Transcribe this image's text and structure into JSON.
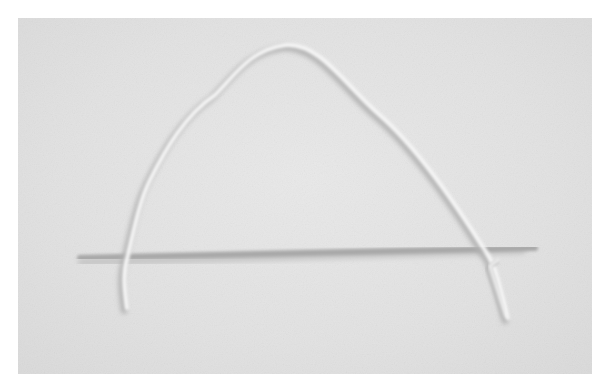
{
  "image": {
    "description": "Photograph of a white string arched over a thin stick on a light gray surface",
    "colors": {
      "background": "#e3e3e3",
      "string": "#f7f7f7",
      "string_shadow": "#b8b8b8",
      "stick": "#a9a9a9",
      "stick_shadow": "#c4c4c4"
    }
  }
}
